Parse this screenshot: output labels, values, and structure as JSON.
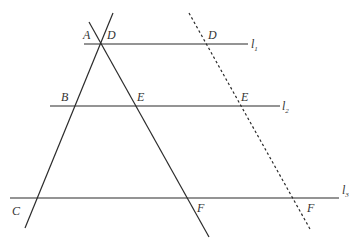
{
  "diagram": {
    "type": "parallel lines cut by transversals",
    "parallel_lines": [
      {
        "id": "l1",
        "label": "l",
        "subscript": "1",
        "y": 44,
        "x1": 84,
        "x2": 248,
        "label_pos": [
          251,
          48
        ]
      },
      {
        "id": "l2",
        "label": "l",
        "subscript": "2",
        "y": 106,
        "x1": 50,
        "x2": 280,
        "label_pos": [
          282,
          110
        ]
      },
      {
        "id": "l3",
        "label": "l",
        "subscript": "3",
        "y": 198,
        "x1": 10,
        "x2": 339,
        "label_pos": [
          342,
          194
        ]
      }
    ],
    "transversals": [
      {
        "id": "line-ABC",
        "style": "solid",
        "x1": 113,
        "y1": 13,
        "x2": 25,
        "y2": 228
      },
      {
        "id": "line-DEF",
        "style": "solid",
        "x1": 89,
        "y1": 22,
        "x2": 209,
        "y2": 237
      },
      {
        "id": "line-DEF-translated",
        "style": "dashed",
        "x1": 189,
        "y1": 13,
        "x2": 310,
        "y2": 229
      }
    ],
    "points": [
      {
        "id": "A",
        "label": "A",
        "pos": [
          83,
          39
        ]
      },
      {
        "id": "D1",
        "label": "D",
        "pos": [
          107,
          39
        ]
      },
      {
        "id": "D2",
        "label": "D",
        "pos": [
          208,
          39
        ]
      },
      {
        "id": "B",
        "label": "B",
        "pos": [
          61,
          101
        ]
      },
      {
        "id": "E1",
        "label": "E",
        "pos": [
          137,
          101
        ]
      },
      {
        "id": "E2",
        "label": "E",
        "pos": [
          241,
          101
        ]
      },
      {
        "id": "C",
        "label": "C",
        "pos": [
          12,
          215
        ]
      },
      {
        "id": "F1",
        "label": "F",
        "pos": [
          197,
          212
        ]
      },
      {
        "id": "F2",
        "label": "F",
        "pos": [
          307,
          212
        ]
      }
    ]
  }
}
